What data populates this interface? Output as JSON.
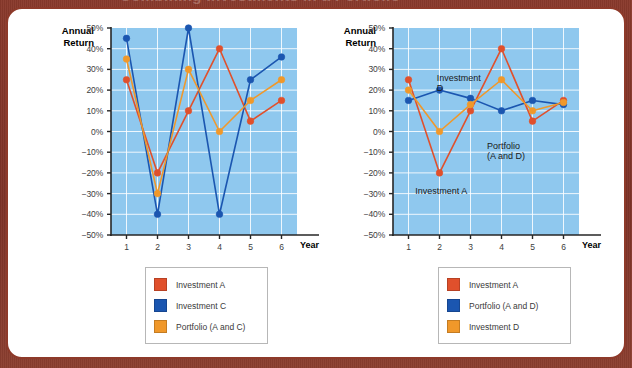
{
  "page": {
    "background_color": "#7e3328",
    "panel_color": "#ffffff",
    "panel_border_color": "#8e3a2a",
    "top_cut_text": "Combining Investments in a Portfolio"
  },
  "palette": {
    "investment_a": "#e0502c",
    "investment_c": "#1b56b0",
    "portfolio_ac": "#f0982a",
    "investment_d": "#f0982a",
    "portfolio_ad": "#1b56b0",
    "plot_background": "#8fc8ee",
    "gridline": "#ffffff",
    "axis": "#262626"
  },
  "chart_data": [
    {
      "id": "left",
      "type": "line",
      "title": "",
      "xlabel": "Year",
      "ylabel": "Annual\nReturn",
      "x": [
        1,
        2,
        3,
        4,
        5,
        6
      ],
      "categories": [
        "1",
        "2",
        "3",
        "4",
        "5",
        "6"
      ],
      "xtick_labels": [
        "1",
        "2",
        "3",
        "4",
        "5",
        "6"
      ],
      "ytick_labels": [
        "50%",
        "40%",
        "30%",
        "20%",
        "10%",
        "0%",
        "−10%",
        "−20%",
        "−30%",
        "−40%",
        "−50%"
      ],
      "ytick_values": [
        50,
        40,
        30,
        20,
        10,
        0,
        -10,
        -20,
        -30,
        -40,
        -50
      ],
      "ylim": [
        -50,
        50
      ],
      "grid": true,
      "legend_position": "below",
      "series": [
        {
          "name": "Investment A",
          "color": "#e0502c",
          "values": [
            25,
            -20,
            10,
            40,
            5,
            15
          ]
        },
        {
          "name": "Investment C",
          "color": "#1b56b0",
          "values": [
            45,
            -40,
            50,
            -40,
            25,
            36
          ]
        },
        {
          "name": "Portfolio (A and C)",
          "color": "#f0982a",
          "values": [
            35,
            -30,
            30,
            0,
            15,
            25
          ]
        }
      ],
      "annotations": []
    },
    {
      "id": "right",
      "type": "line",
      "title": "",
      "xlabel": "Year",
      "ylabel": "Annual\nReturn",
      "x": [
        1,
        2,
        3,
        4,
        5,
        6
      ],
      "categories": [
        "1",
        "2",
        "3",
        "4",
        "5",
        "6"
      ],
      "xtick_labels": [
        "1",
        "2",
        "3",
        "4",
        "5",
        "6"
      ],
      "ytick_labels": [
        "50%",
        "40%",
        "30%",
        "20%",
        "10%",
        "0%",
        "−10%",
        "−20%",
        "−30%",
        "−40%",
        "−50%"
      ],
      "ytick_values": [
        50,
        40,
        30,
        20,
        10,
        0,
        -10,
        -20,
        -30,
        -40,
        -50
      ],
      "ylim": [
        -50,
        50
      ],
      "grid": true,
      "legend_position": "below",
      "series": [
        {
          "name": "Investment A",
          "color": "#e0502c",
          "values": [
            25,
            -20,
            10,
            40,
            5,
            15
          ]
        },
        {
          "name": "Portfolio (A and D)",
          "color": "#1b56b0",
          "values": [
            15,
            20,
            16,
            10,
            15,
            13
          ]
        },
        {
          "name": "Investment D",
          "color": "#f0982a",
          "values": [
            20,
            0,
            13,
            25,
            10,
            14
          ]
        }
      ],
      "annotations": [
        {
          "text": "Investment\nD",
          "x_pct": 23.5,
          "y_pct": 21.5
        },
        {
          "text": "Portfolio\n(A and D)",
          "x_pct": 50.5,
          "y_pct": 54.5
        },
        {
          "text": "Investment A",
          "x_pct": 12.0,
          "y_pct": 76.5
        }
      ]
    }
  ],
  "legends": [
    {
      "id": "legend-left",
      "items": [
        {
          "label": "Investment A",
          "color": "#e0502c"
        },
        {
          "label": "Investment C",
          "color": "#1b56b0"
        },
        {
          "label": "Portfolio (A and C)",
          "color": "#f0982a"
        }
      ]
    },
    {
      "id": "legend-right",
      "items": [
        {
          "label": "Investment A",
          "color": "#e0502c"
        },
        {
          "label": "Portfolio (A and D)",
          "color": "#1b56b0"
        },
        {
          "label": "Investment D",
          "color": "#f0982a"
        }
      ]
    }
  ]
}
